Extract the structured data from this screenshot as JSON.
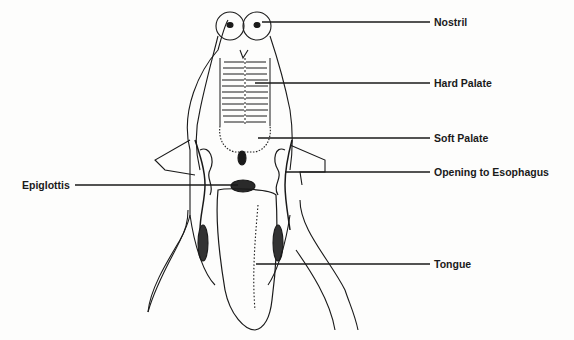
{
  "diagram": {
    "labels": [
      {
        "id": "nostril",
        "text": "Nostril",
        "x": 434,
        "y": 16
      },
      {
        "id": "hard-palate",
        "text": "Hard Palate",
        "x": 434,
        "y": 77
      },
      {
        "id": "soft-palate",
        "text": "Soft Palate",
        "x": 434,
        "y": 132
      },
      {
        "id": "opening-to-esophagus",
        "text": "Opening to Esophagus",
        "x": 434,
        "y": 166
      },
      {
        "id": "epiglottis",
        "text": "Epiglottis",
        "x": 22,
        "y": 179
      },
      {
        "id": "tongue",
        "text": "Tongue",
        "x": 434,
        "y": 258
      }
    ],
    "colors": {
      "line": "#1a1a1a",
      "background": "#fdfdfc"
    }
  }
}
